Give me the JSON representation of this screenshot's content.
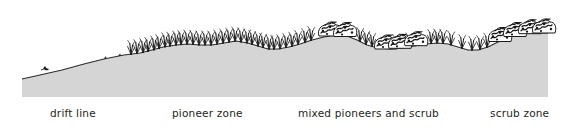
{
  "figure": {
    "name": "sand-dune-succession-profile",
    "style": "pen-and-ink cross-section",
    "background_color": "#ffffff",
    "ground_fill_color": "#d5d5d5",
    "ink_color": "#1a1a1a",
    "label_color": "#231f20"
  },
  "zones": [
    {
      "id": "drift-line",
      "label": "drift line",
      "x": 50,
      "vegetation": "bare sand with scattered drift debris"
    },
    {
      "id": "pioneer-zone",
      "label": "pioneer zone",
      "x": 172,
      "vegetation": "marram grass tufts"
    },
    {
      "id": "mixed-pioneers-and-scrub",
      "label": "mixed pioneers and scrub",
      "x": 298,
      "vegetation": "grass tufts with low shrubs"
    },
    {
      "id": "scrub-zone",
      "label": "scrub zone",
      "x": 490,
      "vegetation": "dense scrub thicket"
    }
  ],
  "profile": {
    "description": "ground surface rising from left strandline to right dune ridge",
    "ground_path": "M 22,97 L 22,79 L 40,75 L 62,70 L 84,64 L 104,59 L 124,55 L 140,53 L 152,50 L 163,47 L 176,45 L 188,44 L 200,45 L 212,45 L 224,43 L 236,41 L 248,43 L 258,46 L 268,49 L 278,49 L 289,47 L 300,44 L 312,40 L 324,37 L 336,35 L 347,36 L 357,40 L 367,45 L 378,48 L 390,49 L 402,48 L 414,46 L 426,44 L 438,43 L 448,44 L 458,47 L 468,50 L 478,50 L 488,47 L 498,42 L 510,37 L 522,34 L 534,33 L 548,33 L 548,97 Z",
    "ground_line": "M 22,79 L 40,75 L 62,70 L 84,64 L 104,59 L 124,55 L 140,53 L 152,50 L 163,47 L 176,45 L 188,44 L 200,45 L 212,45 L 224,43 L 236,41 L 248,43 L 258,46 L 268,49 L 278,49 L 289,47 L 300,44 L 312,40 L 324,37 L 336,35 L 347,36 L 357,40 L 367,45 L 378,48 L 390,49 L 402,48 L 414,46 L 426,44 L 438,43 L 448,44 L 458,47 L 468,50 L 478,50 L 488,47 L 498,42 L 510,37 L 522,34 L 534,33 L 548,33"
  },
  "grass_tufts": {
    "count": 46,
    "x_range": [
      128,
      300
    ],
    "note": "thin splayed vertical ink strokes representing pioneer marram grass"
  },
  "shrub_clumps": {
    "count": 9,
    "x_range": [
      300,
      548
    ],
    "note": "dense scribbled rounded masses representing scrub"
  }
}
